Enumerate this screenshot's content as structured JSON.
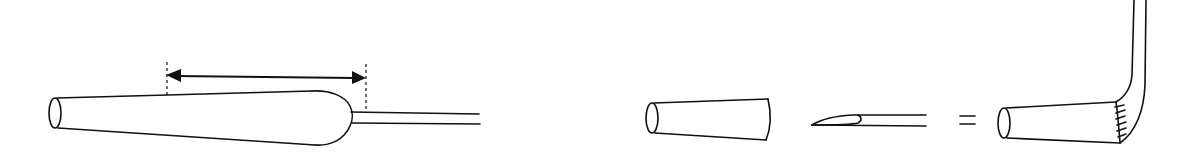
{
  "diagram": {
    "type": "technical-line-drawing",
    "stroke_color": "#111111",
    "background": "#ffffff",
    "figures": [
      {
        "id": "pulled-pipette",
        "description": "Tapered glass tube with bulbous shoulder drawn into a thin capillary, with a double-headed dimension arrow spanning the taper region",
        "parts": [
          "open-end-ellipse",
          "tapered-body",
          "rounded-shoulder",
          "capillary-stem",
          "dimension-arrow",
          "dashed-extension-lines"
        ]
      },
      {
        "id": "assembly-equation",
        "description": "Truncated cone + beveled needle = bent assembly (needle inserted and sealed into cone)",
        "parts": [
          "truncated-cone",
          "beveled-needle",
          "equals-sign",
          "assembled-bent-tube"
        ],
        "operator": "="
      }
    ]
  }
}
